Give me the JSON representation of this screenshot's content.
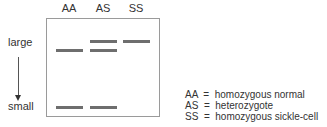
{
  "lanes": [
    {
      "label": "AA"
    },
    {
      "label": "AS"
    },
    {
      "label": "SS"
    }
  ],
  "axis": {
    "top_label": "large",
    "bottom_label": "small"
  },
  "bands": {
    "AA": [
      "lower-large",
      "small"
    ],
    "AS": [
      "upper-large",
      "lower-large",
      "small"
    ],
    "SS": [
      "upper-large"
    ]
  },
  "legend": [
    {
      "code": "AA",
      "meaning": "homozygous normal",
      "text": "AA  =  homozygous normal"
    },
    {
      "code": "AS",
      "meaning": "heterozygote",
      "text": "AS  =  heterozygote"
    },
    {
      "code": "SS",
      "meaning": "homozygous sickle-cell",
      "text": "SS  =  homozygous sickle-cell"
    }
  ],
  "colors": {
    "band": "#6e6e6e",
    "gel_border": "#9a9a9a",
    "text": "#333333"
  }
}
